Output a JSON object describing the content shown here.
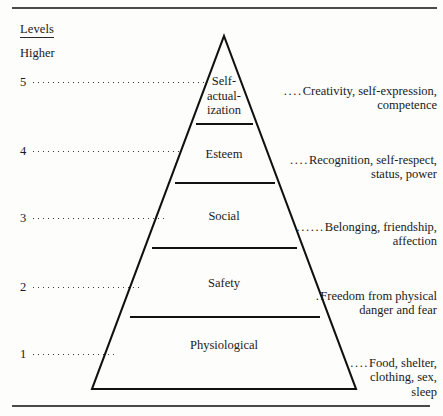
{
  "figure": {
    "title_label": "Levels",
    "subtitle_label": "Higher"
  },
  "pyramid": {
    "tiers": [
      {
        "number": "5",
        "name": "Self-\nactual-\nization",
        "description": "Creativity, self-expression,\ncompetence",
        "leader_dots": "...."
      },
      {
        "number": "4",
        "name": "Esteem",
        "description": "Recognition, self-respect,\nstatus, power",
        "leader_dots": "...."
      },
      {
        "number": "3",
        "name": "Social",
        "description": "Belonging, friendship,\naffection",
        "leader_dots": "......"
      },
      {
        "number": "2",
        "name": "Safety",
        "description": "Freedom from physical\ndanger and fear",
        "leader_dots": "."
      },
      {
        "number": "1",
        "name": "Physiological",
        "description": "Food, shelter,\nclothing, sex,\nsleep",
        "leader_dots": "...."
      }
    ]
  },
  "colors": {
    "ink": "#1a1a1a",
    "rule": "#4a4a4a",
    "outline": "#111111",
    "background": "#fdfdfc"
  }
}
